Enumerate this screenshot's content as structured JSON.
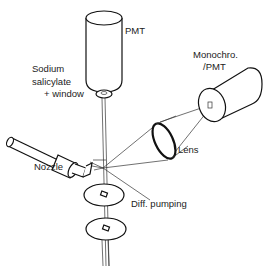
{
  "diagram": {
    "labels": {
      "pmt": "PMT",
      "sodium_line1": "Sodium",
      "sodium_line2": "salicylate",
      "sodium_line3": "+ window",
      "monochro_line1": "Monochro.",
      "monochro_line2": "/PMT",
      "lens": "Lens",
      "nozzle": "Nozzle",
      "diff_pumping": "Diff. pumping"
    },
    "colors": {
      "line": "#111111",
      "background": "#ffffff"
    }
  }
}
